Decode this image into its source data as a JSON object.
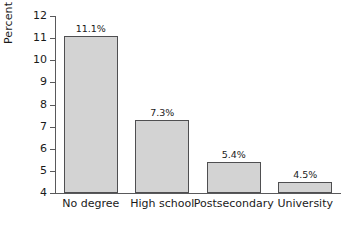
{
  "chart_data": {
    "type": "bar",
    "title": "",
    "xlabel": "",
    "ylabel": "Percent",
    "categories": [
      "No degree",
      "High school",
      "Postsecondary",
      "University"
    ],
    "values": [
      11.1,
      7.3,
      5.4,
      4.5
    ],
    "value_labels": [
      "11.1%",
      "7.3%",
      "5.4%",
      "4.5%"
    ],
    "ylim": [
      4,
      12
    ],
    "yticks": [
      12,
      11,
      10,
      9,
      8,
      7,
      6,
      5,
      4
    ],
    "ytick_labels": [
      "12",
      "11",
      "10",
      "9",
      "8",
      "7",
      "6",
      "5",
      "4"
    ],
    "grid": false,
    "legend": null,
    "colors": {
      "bar_fill": "#d3d3d3",
      "bar_edge": "#4f4f51",
      "axis": "#59595b",
      "text": "#1a1a1a",
      "background": "#ffffff"
    }
  }
}
